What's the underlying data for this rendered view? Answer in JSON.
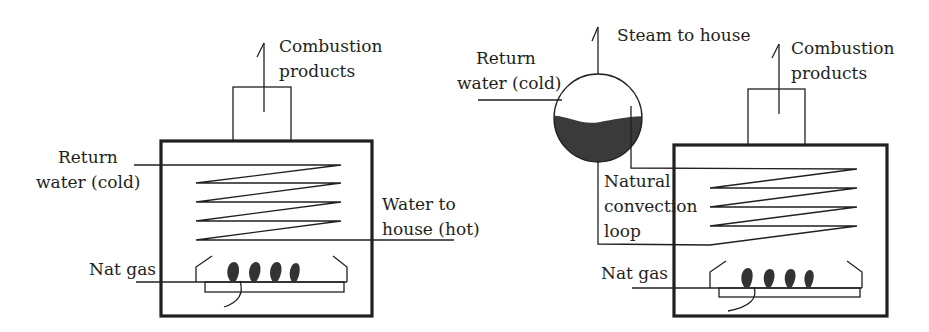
{
  "figure": {
    "colors": {
      "line": "#231f20",
      "water": "#3a3a3a",
      "flame": "#333333",
      "background": "#ffffff"
    }
  },
  "left_boiler": {
    "name": "hot-water-boiler",
    "labels": {
      "combustion_line1": "Combustion",
      "combustion_line2": "products",
      "return_line1": "Return",
      "return_line2": "water (cold)",
      "outlet_line1": "Water to",
      "outlet_line2": "house (hot)",
      "gas": "Nat gas"
    },
    "box": {
      "x": 161,
      "y": 141,
      "w": 211,
      "h": 175
    },
    "chimney": {
      "x": 233,
      "y": 87,
      "w": 58,
      "h": 54
    },
    "exhaust_arrow": {
      "x": 264,
      "y1": 112,
      "y2": 43
    },
    "coil": {
      "left": 196,
      "right": 341,
      "ys": [
        165,
        183,
        202,
        221,
        240
      ]
    },
    "inlet_x": 134,
    "outlet_x": 454,
    "burner": {
      "left": 196,
      "right": 346,
      "gas_y": 282,
      "tray_y": 292,
      "tray_left": 205,
      "tray_right": 344,
      "gas_x": 136
    },
    "flames_x": [
      233,
      254,
      275,
      294
    ]
  },
  "right_boiler": {
    "name": "steam-boiler",
    "labels": {
      "steam": "Steam to house",
      "combustion_line1": "Combustion",
      "combustion_line2": "products",
      "return_line1": "Return",
      "return_line2": "water (cold)",
      "loop_line1": "Natural",
      "loop_line2": "convection",
      "loop_line3": "loop",
      "gas": "Nat gas"
    },
    "drum": {
      "cx": 598,
      "cy": 118,
      "r": 44
    },
    "steam_arrow": {
      "x": 598,
      "y1": 74,
      "y2": 27
    },
    "box": {
      "x": 674,
      "y": 145,
      "w": 213,
      "h": 171
    },
    "chimney": {
      "x": 748,
      "y": 89,
      "w": 57,
      "h": 56
    },
    "exhaust_arrow": {
      "x": 779,
      "y1": 114,
      "y2": 44
    },
    "coil": {
      "left": 710,
      "right": 857,
      "ys": [
        169,
        188,
        207,
        226,
        245
      ]
    },
    "return_line": {
      "x1": 478,
      "x2": 562,
      "y": 100
    },
    "riser_x": 631,
    "riser_top": 106,
    "downcomer_bottom": 244,
    "burner": {
      "left": 710,
      "right": 862,
      "gas_y": 288,
      "tray_y": 297,
      "tray_left": 719,
      "tray_right": 860,
      "gas_x": 632
    },
    "flames_x": [
      747,
      768,
      789,
      808
    ]
  }
}
